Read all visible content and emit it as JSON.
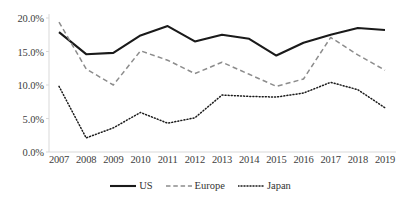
{
  "chart_data": {
    "type": "line",
    "title": "",
    "xlabel": "",
    "ylabel": "",
    "categories": [
      "2007",
      "2008",
      "2009",
      "2010",
      "2011",
      "2012",
      "2013",
      "2014",
      "2015",
      "2016",
      "2017",
      "2018",
      "2019"
    ],
    "x_tick_labels": [
      "2007",
      "2008",
      "2009",
      "2010",
      "2011",
      "2012",
      "2013",
      "2014",
      "2015",
      "2016",
      "2017",
      "2018",
      "2019"
    ],
    "y_tick_labels": [
      "0.0%",
      "5.0%",
      "10.0%",
      "15.0%",
      "20.0%"
    ],
    "y_tick_values": [
      0,
      5,
      10,
      15,
      20
    ],
    "ylim": [
      0,
      20
    ],
    "y_unit": "%",
    "grid": false,
    "legend_position": "bottom",
    "series": [
      {
        "name": "US",
        "label": "US",
        "style": "solid",
        "color": "#1a1a1a",
        "width": 2.1,
        "values": [
          17.9,
          14.6,
          14.8,
          17.4,
          18.8,
          16.5,
          17.5,
          16.9,
          14.4,
          16.3,
          17.5,
          18.5,
          18.2
        ]
      },
      {
        "name": "Europe",
        "label": "Europe",
        "style": "dashed",
        "color": "#8c8c8c",
        "width": 1.5,
        "values": [
          19.4,
          12.4,
          10.0,
          15.1,
          13.7,
          11.7,
          13.4,
          11.6,
          9.8,
          10.9,
          17.1,
          14.5,
          12.2
        ]
      },
      {
        "name": "Japan",
        "label": "Japan",
        "style": "dotted",
        "color": "#1a1a1a",
        "width": 1.5,
        "values": [
          9.8,
          2.1,
          3.6,
          5.9,
          4.3,
          5.1,
          8.5,
          8.3,
          8.2,
          8.8,
          10.4,
          9.3,
          6.6
        ]
      }
    ]
  },
  "legend": {
    "items": [
      {
        "label": "US"
      },
      {
        "label": "Europe"
      },
      {
        "label": "Japan"
      }
    ]
  },
  "axis": {
    "axis_line_color": "#d9d9d9"
  }
}
